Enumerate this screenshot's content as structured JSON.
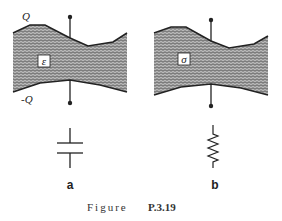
{
  "figure": {
    "caption_prefix": "Figure",
    "caption_id": "P.3.19"
  },
  "panel_a": {
    "top_charge_label": "Q",
    "bottom_charge_label": "-Q",
    "material_symbol": "ε",
    "sublabel": "a",
    "circuit_symbol": "capacitor"
  },
  "panel_b": {
    "material_symbol": "σ",
    "sublabel": "b",
    "circuit_symbol": "resistor"
  },
  "colors": {
    "ink": "#222222",
    "fill_pattern": "#555555",
    "background": "#ffffff"
  }
}
